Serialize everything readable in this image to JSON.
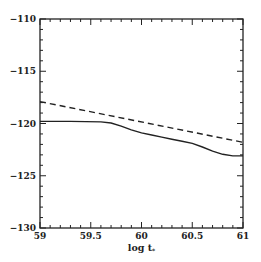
{
  "chart_data": {
    "type": "line",
    "title": "",
    "xlabel": "log t",
    "xlabel_subscript": "*",
    "ylabel": "",
    "xlim": [
      59,
      61
    ],
    "ylim": [
      -130,
      -110
    ],
    "x_ticks": [
      59,
      59.5,
      60,
      60.5,
      61
    ],
    "x_tick_labels": [
      "59",
      "59.5",
      "60",
      "60.5",
      "61"
    ],
    "y_ticks": [
      -110,
      -115,
      -120,
      -125,
      -130
    ],
    "y_tick_labels": [
      "-110",
      "-115",
      "-120",
      "-125",
      "-130"
    ],
    "x_minor_step": 0.1,
    "y_minor_step": 1,
    "grid": false,
    "legend": "none",
    "series": [
      {
        "name": "dashed",
        "style": "dashed",
        "color": "#222222",
        "x": [
          59,
          61
        ],
        "y": [
          -117.9,
          -121.8
        ]
      },
      {
        "name": "solid",
        "style": "solid",
        "color": "#222222",
        "x": [
          59,
          59.3,
          59.6,
          59.7,
          59.8,
          59.9,
          60,
          60.1,
          60.2,
          60.3,
          60.4,
          60.5,
          60.6,
          60.7,
          60.8,
          60.9,
          61
        ],
        "y": [
          -119.8,
          -119.8,
          -119.85,
          -119.95,
          -120.25,
          -120.6,
          -120.9,
          -121.1,
          -121.3,
          -121.5,
          -121.7,
          -121.9,
          -122.25,
          -122.65,
          -122.95,
          -123.1,
          -123.1
        ]
      }
    ]
  }
}
